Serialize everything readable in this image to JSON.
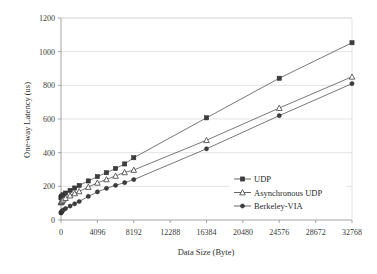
{
  "chart_data": {
    "type": "line",
    "title": "",
    "xlabel": "Data Size (Byte)",
    "ylabel": "One-way Latency (us)",
    "xlim": [
      0,
      32768
    ],
    "ylim": [
      0,
      1200
    ],
    "grid": true,
    "legend_position": "inside-right-lower",
    "xticks": [
      0,
      4096,
      8192,
      12288,
      16384,
      20480,
      24576,
      28672,
      32768
    ],
    "xtick_labels": [
      "0",
      "4096",
      "8192",
      "12288",
      "16384",
      "20480",
      "24576",
      "28672",
      "32768"
    ],
    "yticks": [
      0,
      200,
      400,
      600,
      800,
      1000,
      1200
    ],
    "ytick_labels": [
      "0",
      "200",
      "400",
      "600",
      "800",
      "1000",
      "1200"
    ],
    "series": [
      {
        "name": "UDP",
        "marker": "filled-square",
        "x": [
          4,
          16,
          32,
          64,
          128,
          256,
          512,
          1024,
          1536,
          2048,
          3072,
          4096,
          5120,
          6144,
          7168,
          8192,
          16384,
          24576,
          32768
        ],
        "values": [
          131,
          133,
          135,
          139,
          143,
          150,
          160,
          176,
          190,
          205,
          232,
          258,
          281,
          306,
          333,
          370,
          607,
          842,
          1053
        ]
      },
      {
        "name": "Asynchronous UDP",
        "marker": "open-triangle",
        "x": [
          4,
          16,
          32,
          64,
          128,
          256,
          512,
          1024,
          1536,
          2048,
          3072,
          4096,
          5120,
          6144,
          7168,
          8192,
          16384,
          24576,
          32768
        ],
        "values": [
          104,
          106,
          108,
          111,
          115,
          121,
          130,
          145,
          158,
          170,
          196,
          221,
          241,
          262,
          283,
          297,
          474,
          665,
          851
        ]
      },
      {
        "name": "Berkeley-VIA",
        "marker": "filled-circle",
        "x": [
          4,
          16,
          32,
          64,
          128,
          256,
          512,
          1024,
          1536,
          2048,
          3072,
          4096,
          5120,
          6144,
          7168,
          8192,
          16384,
          24576,
          32768
        ],
        "values": [
          42,
          44,
          46,
          49,
          53,
          59,
          68,
          83,
          96,
          110,
          140,
          167,
          188,
          206,
          222,
          240,
          423,
          620,
          810
        ]
      }
    ]
  },
  "colors": {
    "line": "#555555",
    "grid": "#d9d9d9",
    "axis": "#9a9a9a",
    "text": "#2b2b2b",
    "background": "#ffffff"
  }
}
